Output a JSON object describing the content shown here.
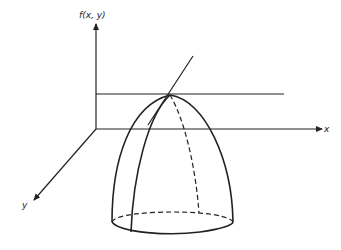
{
  "figure": {
    "axes": {
      "vertical_label": "f(x, y)",
      "x_label": "x",
      "y_label": "y"
    },
    "colors": {
      "stroke": "#222222",
      "background": "#ffffff"
    }
  }
}
